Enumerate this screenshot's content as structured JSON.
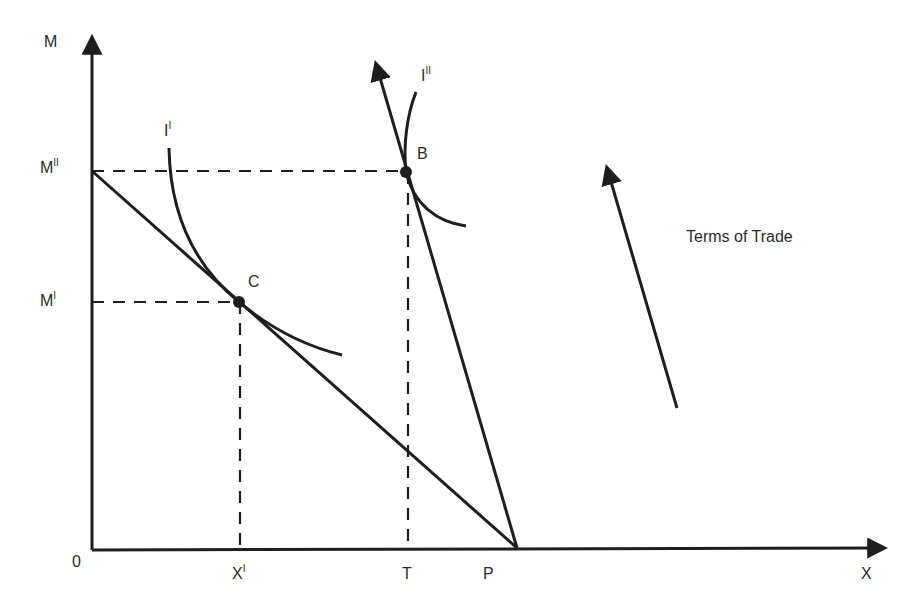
{
  "diagram": {
    "type": "trade-indifference-diagram",
    "axes": {
      "y_label": "M",
      "x_label": "X",
      "origin_label": "0"
    },
    "y_ticks": [
      {
        "base": "M",
        "sup": "II"
      },
      {
        "base": "M",
        "sup": "I"
      }
    ],
    "x_ticks": [
      {
        "base": "X",
        "sup": "I"
      },
      {
        "base": "T",
        "sup": ""
      },
      {
        "base": "P",
        "sup": ""
      }
    ],
    "curves": [
      {
        "base": "I",
        "sup": "I"
      },
      {
        "base": "I",
        "sup": "II"
      }
    ],
    "points": [
      {
        "label": "C"
      },
      {
        "label": "B"
      }
    ],
    "annotation": "Terms of Trade",
    "colors": {
      "line": "#1e1e1e",
      "text": "#2a2a2a",
      "background": "#ffffff"
    }
  }
}
